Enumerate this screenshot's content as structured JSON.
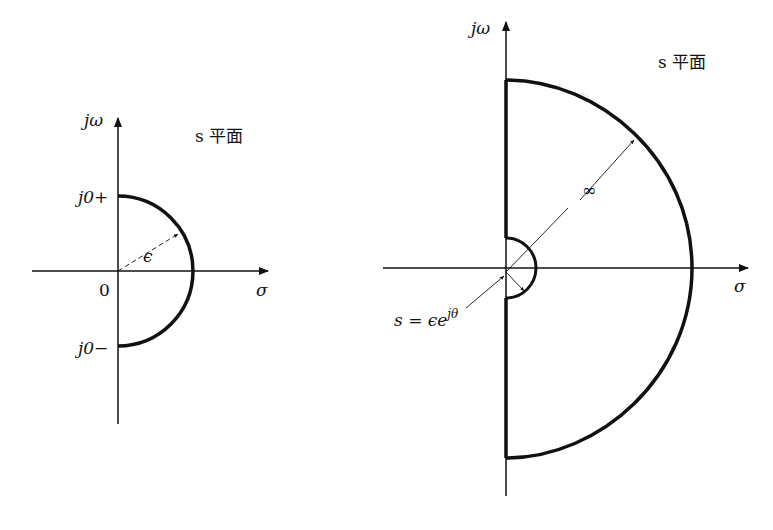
{
  "left_diagram": {
    "axis_y_label": "jω",
    "axis_x_label": "σ",
    "plane_label": "s 平面",
    "origin_label": "0",
    "top_label": "j0+",
    "bottom_label": "j0−",
    "radius_label": "ϵ"
  },
  "right_diagram": {
    "axis_y_label": "jω",
    "axis_x_label": "σ",
    "plane_label": "s 平面",
    "large_radius_label": "∞",
    "small_arc_label": "s = ϵe",
    "small_arc_exponent": "jθ"
  }
}
